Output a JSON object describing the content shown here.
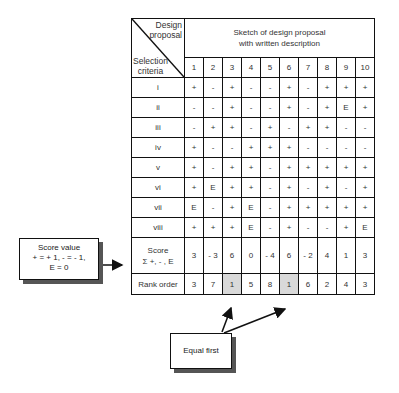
{
  "header": {
    "corner_top_lines": [
      "Design",
      "proposal"
    ],
    "corner_bottom_lines": [
      "Selection",
      "criteria"
    ],
    "sketch_lines": [
      "Sketch of design proposal",
      "with written description"
    ],
    "columns": [
      "1",
      "2",
      "3",
      "4",
      "5",
      "6",
      "7",
      "8",
      "9",
      "10"
    ]
  },
  "rows": [
    {
      "label": "i",
      "cells": [
        "+",
        "-",
        "+",
        "-",
        "-",
        "+",
        "-",
        "+",
        "+",
        "+"
      ]
    },
    {
      "label": "ii",
      "cells": [
        "-",
        "-",
        "+",
        "-",
        "-",
        "+",
        "-",
        "+",
        "E",
        "+"
      ]
    },
    {
      "label": "iii",
      "cells": [
        "-",
        "+",
        "+",
        "-",
        "+",
        "-",
        "+",
        "+",
        "-",
        "-"
      ]
    },
    {
      "label": "iv",
      "cells": [
        "+",
        "-",
        "-",
        "+",
        "+",
        "+",
        "-",
        "-",
        "-",
        "-"
      ]
    },
    {
      "label": "v",
      "cells": [
        "+",
        "-",
        "+",
        "+",
        "-",
        "+",
        "+",
        "+",
        "+",
        "+"
      ]
    },
    {
      "label": "vi",
      "cells": [
        "+",
        "E",
        "+",
        "+",
        "-",
        "+",
        "-",
        "+",
        "-",
        "+"
      ]
    },
    {
      "label": "vii",
      "cells": [
        "E",
        "-",
        "+",
        "E",
        "-",
        "+",
        "+",
        "+",
        "+",
        "+"
      ]
    },
    {
      "label": "viii",
      "cells": [
        "+",
        "+",
        "+",
        "E",
        "-",
        "+",
        "-",
        "-",
        "+",
        "E"
      ]
    }
  ],
  "score": {
    "label_lines": [
      "Score",
      "Σ +, - , E"
    ],
    "cells": [
      "3",
      "- 3",
      "6",
      "0",
      "- 4",
      "6",
      "- 2",
      "4",
      "1",
      "3"
    ]
  },
  "rank": {
    "label": "Rank order",
    "cells": [
      "3",
      "7",
      "1",
      "5",
      "8",
      "1",
      "6",
      "2",
      "4",
      "3"
    ],
    "highlighted_columns": [
      3,
      6
    ],
    "highlight_color": "#d9d9d9"
  },
  "callouts": {
    "score_value_lines": [
      "Score value",
      "+ = + 1, - = - 1,",
      "E = 0"
    ],
    "equal_first": "Equal first"
  }
}
